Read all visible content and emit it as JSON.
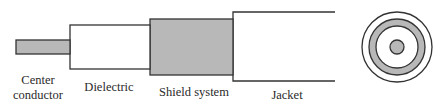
{
  "diagram": {
    "colors": {
      "stroke": "#333333",
      "fill_conductor": "#b8b8b8",
      "fill_white": "#ffffff"
    },
    "labels": {
      "center_conductor_line1": "Center",
      "center_conductor_line2": "conductor",
      "dielectric": "Dielectric",
      "shield_system": "Shield system",
      "jacket": "Jacket"
    },
    "layers": [
      "Center conductor",
      "Dielectric",
      "Shield system",
      "Jacket"
    ],
    "cross_section": {
      "rings": [
        "Jacket",
        "Shield system",
        "Dielectric",
        "Center conductor"
      ]
    }
  }
}
